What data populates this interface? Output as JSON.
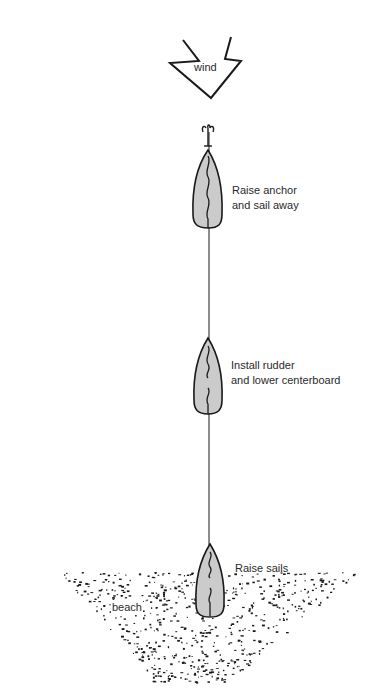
{
  "diagram": {
    "wind": {
      "label": "wind",
      "icon": "wind-arrow-icon"
    },
    "steps": [
      {
        "order": 3,
        "line1": "Raise anchor",
        "line2": "and sail away",
        "icon": "boat-icon",
        "detail": "anchor-icon"
      },
      {
        "order": 2,
        "line1": "Install rudder",
        "line2": "and lower centerboard",
        "icon": "boat-icon"
      },
      {
        "order": 1,
        "line1": "Raise sails",
        "line2": "",
        "icon": "boat-icon"
      }
    ],
    "beach": {
      "label": "beach"
    },
    "colors": {
      "ink": "#1a1a1a",
      "hull_fill": "#c9c9c9",
      "background": "#ffffff"
    }
  }
}
